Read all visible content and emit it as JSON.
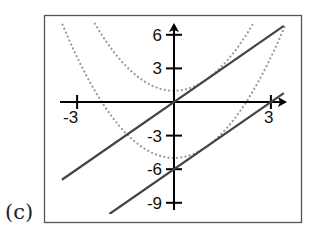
{
  "panel_label": "(c)",
  "colors": {
    "frame": "#555555",
    "axes": "#000000",
    "lines": "#444444",
    "parabolas": "#9a9a9a",
    "background": "#ffffff"
  },
  "chart_data": {
    "type": "line",
    "title": "",
    "panel": "(c)",
    "xlabel": "",
    "ylabel": "",
    "xlim": [
      -3.5,
      3.4
    ],
    "ylim": [
      -10,
      7
    ],
    "grid": false,
    "legend": null,
    "x_ticks": [
      -3,
      3
    ],
    "x_tick_labels": [
      "-3",
      "3"
    ],
    "y_ticks": [
      6,
      3,
      -3,
      -6,
      -9
    ],
    "y_tick_labels": [
      "6",
      "3",
      "-3",
      "-6",
      "-9"
    ],
    "series": [
      {
        "name": "y = 2x",
        "style": "solid",
        "x": [
          -3.47,
          3.4
        ],
        "y": [
          -6.94,
          6.8
        ]
      },
      {
        "name": "y = 2x - 6",
        "style": "solid",
        "x": [
          -2.0,
          3.4
        ],
        "y": [
          -10.0,
          0.8
        ]
      },
      {
        "name": "y = x^2 + 1",
        "style": "dotted",
        "x": [
          -2.45,
          -2,
          -1.5,
          -1,
          -0.5,
          0,
          0.5,
          1,
          1.5,
          2,
          2.45
        ],
        "y": [
          7.0,
          5.0,
          3.25,
          2.0,
          1.25,
          1.0,
          1.25,
          2.0,
          3.25,
          5.0,
          7.0
        ]
      },
      {
        "name": "y = x^2 - 5",
        "style": "dotted",
        "x": [
          -3.46,
          -3,
          -2,
          -1,
          0,
          1,
          2,
          3,
          3.46
        ],
        "y": [
          7.0,
          4.0,
          -1.0,
          -4.0,
          -5.0,
          -4.0,
          -1.0,
          4.0,
          7.0
        ]
      }
    ],
    "annotations": [
      "Lines are tangent to the parabolas at x = 1"
    ]
  }
}
